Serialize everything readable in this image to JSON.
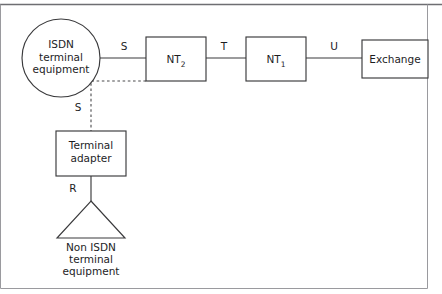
{
  "figure": {
    "nodes": {
      "isdn_terminal_equipment": {
        "shape": "circle",
        "lines": [
          "ISDN",
          "terminal",
          "equipment"
        ]
      },
      "nt2": {
        "shape": "rectangle",
        "label_base": "NT",
        "label_sub": "2"
      },
      "nt1": {
        "shape": "rectangle",
        "label_base": "NT",
        "label_sub": "1"
      },
      "exchange": {
        "shape": "rectangle",
        "label": "Exchange"
      },
      "terminal_adapter": {
        "shape": "rectangle",
        "lines": [
          "Terminal",
          "adapter"
        ]
      },
      "non_isdn_terminal_equipment": {
        "shape": "triangle",
        "lines": [
          "Non ISDN",
          "terminal",
          "equipment"
        ]
      }
    },
    "interface_labels": {
      "s_top": "S",
      "t": "T",
      "u": "U",
      "s_branch": "S",
      "r": "R"
    },
    "colors": {
      "stroke": "#3a3a3c",
      "text": "#1d1d1f",
      "frame": "#9a9a9e",
      "background": "#ffffff"
    }
  }
}
